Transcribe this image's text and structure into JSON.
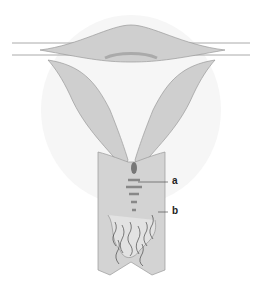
{
  "diagram": {
    "labels": [
      {
        "id": "a",
        "text": "a"
      },
      {
        "id": "b",
        "text": "b"
      }
    ],
    "colors": {
      "tissue": "#cfcfcf",
      "tissue_dark": "#b5b5b5",
      "outline": "#9a9a9a",
      "mucus": "#777777",
      "background": "#ffffff"
    }
  }
}
